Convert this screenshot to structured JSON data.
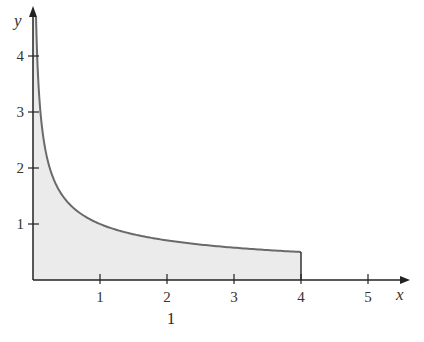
{
  "chart_data": {
    "type": "area",
    "function": "y = 1/sqrt(x)",
    "title": "",
    "xlabel": "x",
    "ylabel": "y",
    "xlim": [
      0,
      5.5
    ],
    "ylim": [
      0,
      4.5
    ],
    "x_ticks": [
      1,
      2,
      3,
      4,
      5
    ],
    "y_ticks": [
      1,
      2,
      3,
      4
    ],
    "shaded_region": {
      "x_from": 0,
      "x_to": 4,
      "description": "area under curve from 0 to 4"
    },
    "x": [
      0.05,
      0.1,
      0.25,
      0.5,
      1,
      1.5,
      2,
      2.5,
      3,
      3.5,
      4
    ],
    "values": [
      4.47,
      3.16,
      2.0,
      1.41,
      1.0,
      0.82,
      0.71,
      0.63,
      0.58,
      0.53,
      0.5
    ],
    "grid": false,
    "legend": null,
    "colors": {
      "fill": "#ebebeb",
      "curve": "#6a6a6a",
      "axis": "#222222"
    }
  },
  "axes": {
    "x_label": "x",
    "y_label": "y",
    "x_tick_labels": [
      "1",
      "2",
      "3",
      "4",
      "5"
    ],
    "y_tick_labels": [
      "1",
      "2",
      "3",
      "4"
    ]
  },
  "caption": {
    "fraction_numerator": "1",
    "text_partial": "Figure"
  }
}
